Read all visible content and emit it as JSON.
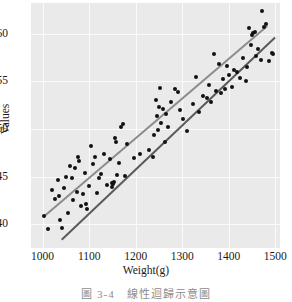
{
  "caption": "圖 3-4　線性迴歸示意圖",
  "chart_data": {
    "type": "scatter",
    "title": "",
    "xlabel": "Weight(g)",
    "ylabel": "Values",
    "xlim": [
      975,
      1510
    ],
    "ylim": [
      37.5,
      63.2
    ],
    "xticks": [
      1000,
      1100,
      1200,
      1300,
      1400,
      1500
    ],
    "yticks": [
      40,
      45,
      50,
      55,
      60
    ],
    "xtick_labels": [
      "1000",
      "1100",
      "1200",
      "1300",
      "1400",
      "1500"
    ],
    "ytick_labels": [
      "40",
      "45",
      "50",
      "55",
      "60"
    ],
    "grid": true,
    "grid_color": "#fbfbfb",
    "plot_background": "#eaeaea",
    "legend": null,
    "legend_position": "none",
    "point_color": "#121212",
    "points": [
      [
        1003,
        40.9
      ],
      [
        1012,
        39.5
      ],
      [
        1020,
        43.6
      ],
      [
        1027,
        42.6
      ],
      [
        1033,
        44.6
      ],
      [
        1036,
        43.0
      ],
      [
        1038,
        40.4
      ],
      [
        1042,
        39.6
      ],
      [
        1046,
        43.8
      ],
      [
        1050,
        45.0
      ],
      [
        1055,
        41.2
      ],
      [
        1058,
        46.1
      ],
      [
        1062,
        44.8
      ],
      [
        1066,
        42.5
      ],
      [
        1070,
        45.9
      ],
      [
        1073,
        43.4
      ],
      [
        1076,
        47.0
      ],
      [
        1078,
        46.6
      ],
      [
        1082,
        41.9
      ],
      [
        1086,
        43.2
      ],
      [
        1090,
        45.4
      ],
      [
        1093,
        42.1
      ],
      [
        1096,
        41.6
      ],
      [
        1100,
        44.0
      ],
      [
        1104,
        48.2
      ],
      [
        1108,
        46.3
      ],
      [
        1112,
        47.1
      ],
      [
        1116,
        43.3
      ],
      [
        1120,
        44.9
      ],
      [
        1126,
        45.3
      ],
      [
        1132,
        47.4
      ],
      [
        1138,
        44.1
      ],
      [
        1144,
        46.8
      ],
      [
        1148,
        44.3
      ],
      [
        1150,
        43.9
      ],
      [
        1152,
        44.2
      ],
      [
        1154,
        44.4
      ],
      [
        1156,
        49.0
      ],
      [
        1158,
        48.6
      ],
      [
        1160,
        45.2
      ],
      [
        1164,
        46.4
      ],
      [
        1168,
        50.2
      ],
      [
        1172,
        50.5
      ],
      [
        1176,
        45.1
      ],
      [
        1182,
        48.4
      ],
      [
        1196,
        46.9
      ],
      [
        1210,
        47.4
      ],
      [
        1228,
        47.8
      ],
      [
        1236,
        47.0
      ],
      [
        1240,
        49.4
      ],
      [
        1243,
        53.0
      ],
      [
        1245,
        51.4
      ],
      [
        1247,
        49.9
      ],
      [
        1250,
        52.3
      ],
      [
        1252,
        54.3
      ],
      [
        1255,
        50.6
      ],
      [
        1258,
        52.1
      ],
      [
        1262,
        48.6
      ],
      [
        1266,
        51.6
      ],
      [
        1270,
        50.2
      ],
      [
        1276,
        52.8
      ],
      [
        1284,
        54.2
      ],
      [
        1290,
        53.9
      ],
      [
        1296,
        52.0
      ],
      [
        1302,
        51.0
      ],
      [
        1310,
        49.8
      ],
      [
        1322,
        52.6
      ],
      [
        1330,
        55.4
      ],
      [
        1336,
        51.8
      ],
      [
        1344,
        53.4
      ],
      [
        1352,
        53.2
      ],
      [
        1358,
        54.6
      ],
      [
        1362,
        52.8
      ],
      [
        1368,
        57.9
      ],
      [
        1372,
        54.0
      ],
      [
        1378,
        56.8
      ],
      [
        1384,
        53.8
      ],
      [
        1388,
        55.2
      ],
      [
        1392,
        54.2
      ],
      [
        1396,
        56.6
      ],
      [
        1400,
        55.7
      ],
      [
        1406,
        54.4
      ],
      [
        1412,
        56.2
      ],
      [
        1418,
        56.0
      ],
      [
        1424,
        55.3
      ],
      [
        1430,
        57.4
      ],
      [
        1436,
        55.0
      ],
      [
        1440,
        56.5
      ],
      [
        1444,
        60.6
      ],
      [
        1448,
        58.8
      ],
      [
        1450,
        59.8
      ],
      [
        1452,
        60.1
      ],
      [
        1456,
        60.2
      ],
      [
        1458,
        57.6
      ],
      [
        1462,
        58.4
      ],
      [
        1468,
        57.2
      ],
      [
        1472,
        62.4
      ],
      [
        1476,
        60.7
      ],
      [
        1480,
        61.0
      ],
      [
        1486,
        57.1
      ],
      [
        1492,
        58.0
      ],
      [
        1495,
        57.9
      ]
    ],
    "series": [
      {
        "name": "fit-line-upper",
        "type": "line",
        "color": "#8c8c8c",
        "width": 2,
        "x0": 1001,
        "y0": 40.9,
        "x1": 1481,
        "y1": 60.9
      },
      {
        "name": "fit-line-lower",
        "type": "line",
        "color": "#5a5a5a",
        "width": 2,
        "x0": 1040,
        "y0": 38.4,
        "x1": 1498,
        "y1": 59.6
      }
    ]
  }
}
